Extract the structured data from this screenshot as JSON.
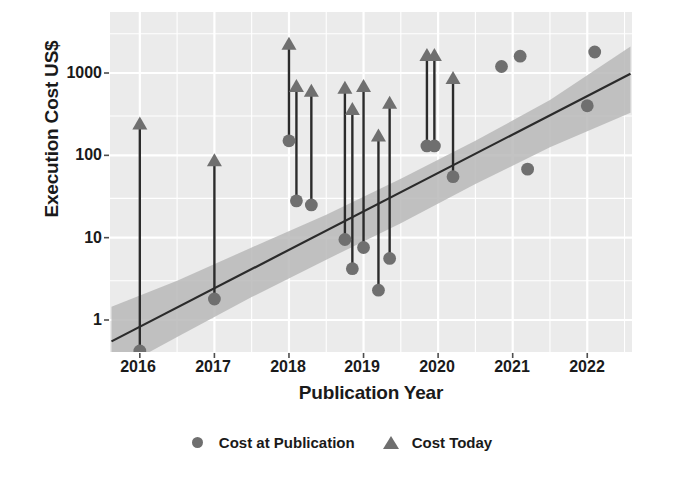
{
  "chart_data": {
    "type": "scatter",
    "title": "",
    "xlabel": "Publication Year",
    "ylabel": "Execution Cost US$",
    "yscale": "log",
    "ylim": [
      0.3,
      4000
    ],
    "xlim": [
      2015.6,
      2022.6
    ],
    "xticks": [
      2016,
      2017,
      2018,
      2019,
      2020,
      2021,
      2022
    ],
    "xtick_labels": [
      "2016",
      "2017",
      "2018",
      "2019",
      "2020",
      "2021",
      "2022"
    ],
    "yticks": [
      1,
      10,
      100,
      1000
    ],
    "ytick_labels": [
      "1",
      "10",
      "100",
      "1000"
    ],
    "grid": true,
    "legend_position": "bottom",
    "legend": [
      {
        "label": "Cost at Publication",
        "marker": "circle",
        "color": "#6f6f6f"
      },
      {
        "label": "Cost Today",
        "marker": "triangle",
        "color": "#6f6f6f"
      }
    ],
    "series": [
      {
        "name": "Cost at Publication",
        "marker": "circle",
        "color": "#6f6f6f",
        "points": [
          {
            "x": 2016.0,
            "y": 0.42
          },
          {
            "x": 2017.0,
            "y": 1.8
          },
          {
            "x": 2018.0,
            "y": 150
          },
          {
            "x": 2018.1,
            "y": 28
          },
          {
            "x": 2018.3,
            "y": 25
          },
          {
            "x": 2018.75,
            "y": 9.5
          },
          {
            "x": 2018.85,
            "y": 4.2
          },
          {
            "x": 2019.0,
            "y": 7.6
          },
          {
            "x": 2019.2,
            "y": 2.3
          },
          {
            "x": 2019.35,
            "y": 5.6
          },
          {
            "x": 2019.85,
            "y": 130
          },
          {
            "x": 2019.95,
            "y": 130
          },
          {
            "x": 2020.2,
            "y": 55
          },
          {
            "x": 2020.85,
            "y": 1200
          },
          {
            "x": 2021.1,
            "y": 1600
          },
          {
            "x": 2021.2,
            "y": 68
          },
          {
            "x": 2022.0,
            "y": 400
          },
          {
            "x": 2022.1,
            "y": 1800
          }
        ]
      },
      {
        "name": "Cost Today",
        "marker": "triangle",
        "color": "#6f6f6f",
        "points": [
          {
            "x": 2016.0,
            "y": 280
          },
          {
            "x": 2017.0,
            "y": 100
          },
          {
            "x": 2018.0,
            "y": 2600
          },
          {
            "x": 2018.1,
            "y": 800
          },
          {
            "x": 2018.3,
            "y": 700
          },
          {
            "x": 2018.75,
            "y": 760
          },
          {
            "x": 2018.85,
            "y": 420
          },
          {
            "x": 2019.0,
            "y": 800
          },
          {
            "x": 2019.2,
            "y": 200
          },
          {
            "x": 2019.35,
            "y": 500
          },
          {
            "x": 2019.85,
            "y": 1900
          },
          {
            "x": 2019.95,
            "y": 1900
          },
          {
            "x": 2020.2,
            "y": 1000
          }
        ]
      }
    ],
    "connectors": [
      {
        "x": 2016.0,
        "y0": 0.42,
        "y1": 280
      },
      {
        "x": 2017.0,
        "y0": 1.8,
        "y1": 100
      },
      {
        "x": 2018.0,
        "y0": 150,
        "y1": 2600
      },
      {
        "x": 2018.1,
        "y0": 28,
        "y1": 800
      },
      {
        "x": 2018.3,
        "y0": 25,
        "y1": 700
      },
      {
        "x": 2018.75,
        "y0": 9.5,
        "y1": 760
      },
      {
        "x": 2018.85,
        "y0": 4.2,
        "y1": 420
      },
      {
        "x": 2019.0,
        "y0": 7.6,
        "y1": 800
      },
      {
        "x": 2019.2,
        "y0": 2.3,
        "y1": 200
      },
      {
        "x": 2019.35,
        "y0": 5.6,
        "y1": 500
      },
      {
        "x": 2019.85,
        "y0": 130,
        "y1": 1900
      },
      {
        "x": 2019.95,
        "y0": 130,
        "y1": 1900
      },
      {
        "x": 2020.2,
        "y0": 55,
        "y1": 1000
      }
    ],
    "trend": {
      "name": "linear fit (log scale)",
      "x0": 2015.62,
      "y0": 0.55,
      "x1": 2022.58,
      "y1": 980,
      "band_lower": [
        {
          "x": 2015.62,
          "y": 0.23
        },
        {
          "x": 2016.5,
          "y": 0.62
        },
        {
          "x": 2017.5,
          "y": 1.9
        },
        {
          "x": 2018.5,
          "y": 5.4
        },
        {
          "x": 2019.5,
          "y": 15
        },
        {
          "x": 2020.5,
          "y": 45
        },
        {
          "x": 2021.5,
          "y": 125
        },
        {
          "x": 2022.58,
          "y": 330
        }
      ],
      "band_upper": [
        {
          "x": 2015.62,
          "y": 1.45
        },
        {
          "x": 2016.5,
          "y": 3.0
        },
        {
          "x": 2017.5,
          "y": 7.6
        },
        {
          "x": 2018.5,
          "y": 19
        },
        {
          "x": 2019.5,
          "y": 52
        },
        {
          "x": 2020.5,
          "y": 150
        },
        {
          "x": 2021.5,
          "y": 470
        },
        {
          "x": 2022.58,
          "y": 2100
        }
      ]
    },
    "colors": {
      "panel_background": "#ebebeb",
      "grid": "#ffffff",
      "marker": "#6f6f6f",
      "trend_line": "#2b2b2b",
      "trend_band": "#b8b8b8",
      "connector": "#2b2b2b",
      "text": "#1a1a1a"
    }
  }
}
